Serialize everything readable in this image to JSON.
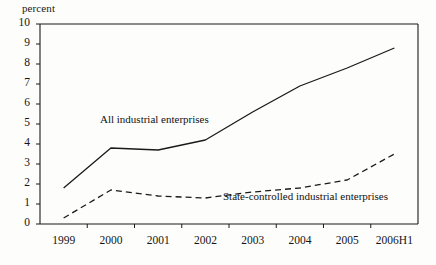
{
  "chart_data": {
    "type": "line",
    "title": "",
    "subtitle": "",
    "xlabel": "",
    "ylabel": "percent",
    "ylim": [
      0,
      10
    ],
    "ytick_labels": [
      "10",
      "9",
      "8",
      "7",
      "6",
      "5",
      "4",
      "3",
      "2",
      "1",
      "0"
    ],
    "ytick_values": [
      10,
      9,
      8,
      7,
      6,
      5,
      4,
      3,
      2,
      1,
      0
    ],
    "categories": [
      "1999",
      "2000",
      "2001",
      "2002",
      "2003",
      "2004",
      "2005",
      "2006H1"
    ],
    "grid": false,
    "legend_position": "inline-annotation",
    "series": [
      {
        "name": "All industrial enterprises",
        "style": "solid",
        "color": "#1a1a1a",
        "values": [
          1.8,
          3.8,
          3.7,
          4.2,
          5.6,
          6.9,
          7.8,
          8.8
        ]
      },
      {
        "name": "State-controlled industrial enterprises",
        "style": "dashed",
        "color": "#1a1a1a",
        "values": [
          0.3,
          1.7,
          1.4,
          1.3,
          1.6,
          1.8,
          2.2,
          3.5
        ]
      }
    ],
    "annotations": [
      {
        "text": "All industrial enterprises",
        "series": "All industrial enterprises",
        "x_px": 100,
        "y_px": 113
      },
      {
        "text": "State-controlled industrial enterprises",
        "series": "State-controlled industrial enterprises",
        "x_px": 223,
        "y_px": 190
      }
    ]
  }
}
